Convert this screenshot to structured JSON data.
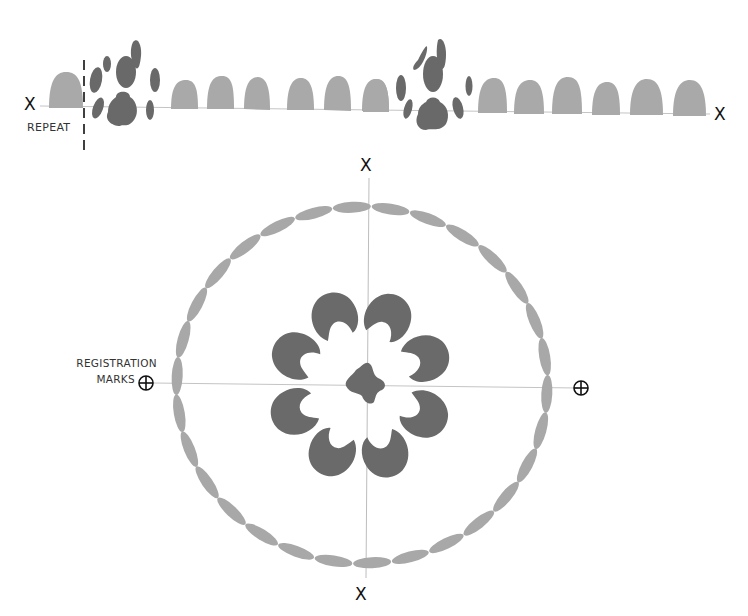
{
  "diagram": {
    "type": "stencil-pattern-layout",
    "colors": {
      "light_motif": "#a8a8a8",
      "dark_motif": "#6a6a6a",
      "guide_line": "#bdbdbd",
      "ink": "#111111"
    },
    "border_strip": {
      "axis_marks": [
        "X",
        "X"
      ],
      "repeat_label": "REPEAT",
      "scallop_count_left_group": 6,
      "scallop_count_right_group": 6,
      "paw_motif_count": 2
    },
    "medallion": {
      "axis_marks": [
        "X",
        "X"
      ],
      "registration_label_line1": "REGISTRATION",
      "registration_label_line2": "MARKS",
      "outer_ring_leaf_count": 30,
      "inner_petal_count": 8,
      "center_motif": "four-lobed center"
    }
  }
}
